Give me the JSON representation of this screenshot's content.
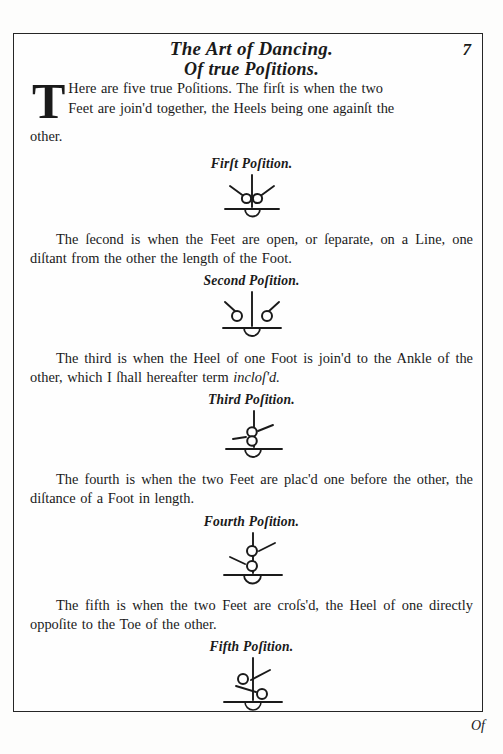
{
  "page": {
    "running_head_line1": "The Art of Dancing.",
    "running_head_line2": "Of true Poſitions.",
    "folio": "7",
    "catchword": "Of",
    "border_color": "#262626",
    "paper_color": "#fefefe",
    "ink_color": "#1a1a1a"
  },
  "intro": {
    "dropcap": "T",
    "text_line1": "Here are five true Poſitions.   The firſt is when the two",
    "text_line2": "Feet are join'd together, the Heels being one againſt the",
    "text_line3": "other."
  },
  "positions": [
    {
      "id": "first",
      "body": "",
      "caption": "Firſt Poſition.",
      "figure_name": "first-position-diagram"
    },
    {
      "id": "second",
      "body": "The ſecond is when the Feet are open, or ſeparate, on a Line, one diſtant from the other the length of the Foot.",
      "caption": "Second Poſition.",
      "figure_name": "second-position-diagram"
    },
    {
      "id": "third",
      "body_pre": "The third is when the Heel of one Foot is join'd to the Ankle of the other, which I ſhall hereafter term ",
      "body_italic": "incloſ'd.",
      "caption": "Third Poſition.",
      "figure_name": "third-position-diagram"
    },
    {
      "id": "fourth",
      "body": "The fourth is when the two Feet are plac'd one before the other, the diſtance of a Foot in length.",
      "caption": "Fourth Poſition.",
      "figure_name": "fourth-position-diagram"
    },
    {
      "id": "fifth",
      "body": "The fifth is when the two Feet are croſs'd,  the Heel of one directly oppoſite to the Toe of the other.",
      "caption": "Fifth Poſition.",
      "figure_name": "fifth-position-diagram"
    }
  ]
}
